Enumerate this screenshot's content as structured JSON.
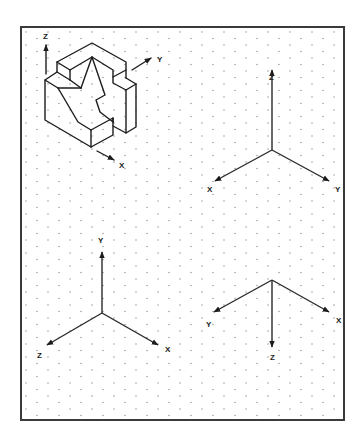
{
  "figure": {
    "frame": {
      "x": 21,
      "y": 27,
      "width": 323,
      "height": 393,
      "color": "#3a3a3a"
    },
    "grid": {
      "type": "isometric-dot-grid",
      "dot_color": "#8a8a8a",
      "col_spacing": 11,
      "row_spacing": 13
    },
    "object": {
      "name": "isometric-block",
      "axes": {
        "z": {
          "label": "Z",
          "direction": "up"
        },
        "y": {
          "label": "Y",
          "direction": "up-right"
        },
        "x": {
          "label": "X",
          "direction": "down-right"
        }
      }
    },
    "axis_sets": [
      {
        "name": "top-right",
        "origin": [
          272,
          150
        ],
        "labels": {
          "up": "Z",
          "down_left": "X",
          "down_right": "Y"
        }
      },
      {
        "name": "bottom-left",
        "origin": [
          102,
          313
        ],
        "labels": {
          "up": "Y",
          "down_left": "Z",
          "down_right": "X"
        }
      },
      {
        "name": "bottom-right",
        "origin": [
          272,
          280
        ],
        "labels": {
          "down_left": "Y",
          "down_right": "X",
          "down": "Z"
        }
      }
    ]
  },
  "labels": {
    "obj_z": "Z",
    "obj_y": "Y",
    "obj_x": "X",
    "a1_z": "Z",
    "a1_x": "X",
    "a1_y": "Y",
    "a2_y": "Y",
    "a2_z": "Z",
    "a2_x": "X",
    "a3_y": "Y",
    "a3_x": "X",
    "a3_z": "Z"
  }
}
